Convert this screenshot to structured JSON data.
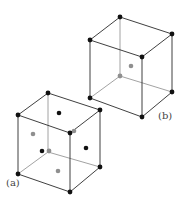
{
  "diagram": {
    "type": "crystal unit cells",
    "colors": {
      "edge": "#2a2a2a",
      "hidden_edge": "#8a8a8a",
      "atom_black": "#111111",
      "atom_gray": "#8f8f8f"
    },
    "cubes": [
      {
        "id": "a",
        "label": "(a)",
        "label_pos": [
          6,
          186
        ],
        "vertices": {
          "tb": [
            48,
            93
          ],
          "tr": [
            100,
            110
          ],
          "tl": [
            18,
            115
          ],
          "tf": [
            70,
            133
          ],
          "bb": [
            48,
            152
          ],
          "br": [
            100,
            167
          ],
          "bl": [
            18,
            174
          ],
          "bf": [
            70,
            192
          ]
        },
        "corner_atoms": [
          {
            "p": [
              48,
              93
            ],
            "c": "black"
          },
          {
            "p": [
              100,
              110
            ],
            "c": "black"
          },
          {
            "p": [
              18,
              115
            ],
            "c": "black"
          },
          {
            "p": [
              70,
              133
            ],
            "c": "black"
          },
          {
            "p": [
              49,
              151
            ],
            "c": "gray"
          },
          {
            "p": [
              100,
              167
            ],
            "c": "black"
          },
          {
            "p": [
              18,
              174
            ],
            "c": "black"
          },
          {
            "p": [
              70,
              192
            ],
            "c": "black"
          }
        ],
        "face_atoms": [
          {
            "p": [
              59,
              113
            ],
            "c": "black"
          },
          {
            "p": [
              33,
              134
            ],
            "c": "gray"
          },
          {
            "p": [
              86,
              148
            ],
            "c": "black"
          },
          {
            "p": [
              42,
              151
            ],
            "c": "black"
          },
          {
            "p": [
              58,
              171
            ],
            "c": "gray"
          },
          {
            "p": [
              74,
              131
            ],
            "c": "gray"
          }
        ]
      },
      {
        "id": "b",
        "label": "(b)",
        "label_pos": [
          158,
          119
        ],
        "vertices": {
          "tb": [
            120,
            17
          ],
          "tr": [
            172,
            34
          ],
          "tl": [
            90,
            40
          ],
          "tf": [
            142,
            57
          ],
          "bb": [
            120,
            76
          ],
          "br": [
            172,
            92
          ],
          "bl": [
            90,
            98
          ],
          "bf": [
            142,
            117
          ]
        },
        "corner_atoms": [
          {
            "p": [
              120,
              17
            ],
            "c": "black"
          },
          {
            "p": [
              172,
              34
            ],
            "c": "black"
          },
          {
            "p": [
              90,
              40
            ],
            "c": "black"
          },
          {
            "p": [
              142,
              57
            ],
            "c": "black"
          },
          {
            "p": [
              120,
              76
            ],
            "c": "gray"
          },
          {
            "p": [
              172,
              92
            ],
            "c": "black"
          },
          {
            "p": [
              90,
              98
            ],
            "c": "black"
          },
          {
            "p": [
              142,
              117
            ],
            "c": "black"
          }
        ],
        "face_atoms": [
          {
            "p": [
              131,
              66
            ],
            "c": "gray"
          }
        ]
      }
    ]
  }
}
